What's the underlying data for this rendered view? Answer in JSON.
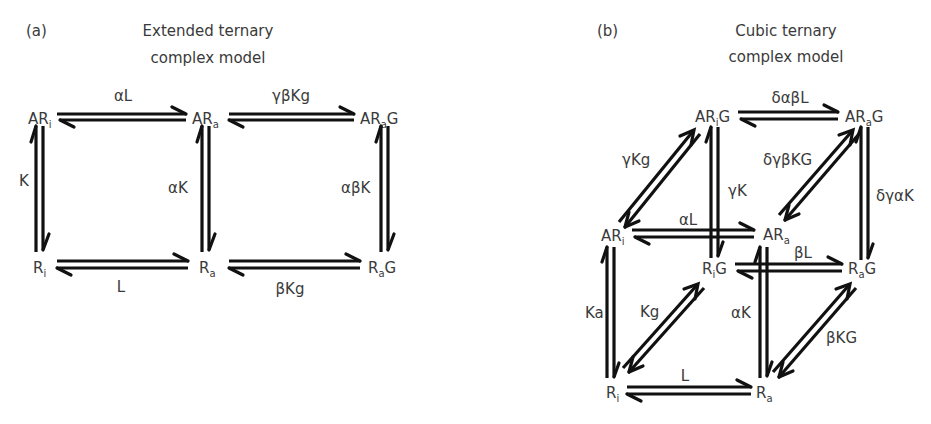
{
  "panel_a": {
    "tag": "(a)",
    "title_line1": "Extended ternary",
    "title_line2": "complex model",
    "nodes": {
      "ARi": {
        "base": "AR",
        "sub": "i",
        "suffix": ""
      },
      "ARa": {
        "base": "AR",
        "sub": "a",
        "suffix": ""
      },
      "ARaG": {
        "base": "AR",
        "sub": "a",
        "suffix": "G"
      },
      "Ri": {
        "base": "R",
        "sub": "i",
        "suffix": ""
      },
      "Ra": {
        "base": "R",
        "sub": "a",
        "suffix": ""
      },
      "RaG": {
        "base": "R",
        "sub": "a",
        "suffix": "G"
      }
    },
    "edges": {
      "ARi_ARa": "αL",
      "ARa_ARaG": "γβKg",
      "Ri_ARi": "K",
      "Ra_ARa": "αK",
      "RaG_ARaG": "αβK",
      "Ri_Ra": "L",
      "Ra_RaG": "βKg"
    }
  },
  "panel_b": {
    "tag": "(b)",
    "title_line1": "Cubic ternary",
    "title_line2": "complex model",
    "nodes": {
      "ARiG": {
        "base": "AR",
        "sub": "i",
        "suffix": "G"
      },
      "ARaG": {
        "base": "AR",
        "sub": "a",
        "suffix": "G"
      },
      "ARi": {
        "base": "AR",
        "sub": "i",
        "suffix": ""
      },
      "ARa": {
        "base": "AR",
        "sub": "a",
        "suffix": ""
      },
      "RiG": {
        "base": "R",
        "sub": "i",
        "suffix": "G"
      },
      "RaG": {
        "base": "R",
        "sub": "a",
        "suffix": "G"
      },
      "Ri": {
        "base": "R",
        "sub": "i",
        "suffix": ""
      },
      "Ra": {
        "base": "R",
        "sub": "a",
        "suffix": ""
      }
    },
    "edges": {
      "ARiG_ARaG": "δαβL",
      "ARi_ARiG": "γKg",
      "ARa_ARaG": "δγβKG",
      "RiG_ARiG": "γK",
      "RaG_ARaG": "δγαK",
      "ARi_ARa": "αL",
      "RiG_RaG": "βL",
      "Ri_ARi": "Ka",
      "Ri_RiG": "Kg",
      "Ra_ARa": "αK",
      "Ra_RaG": "βKG",
      "Ri_Ra": "L"
    }
  }
}
